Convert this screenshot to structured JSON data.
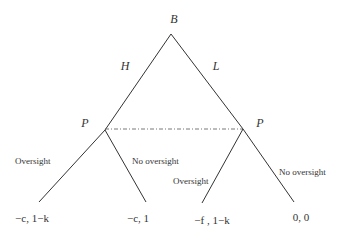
{
  "diagram": {
    "type": "game-tree",
    "root": {
      "label": "B"
    },
    "first_moves": [
      {
        "label": "H"
      },
      {
        "label": "L"
      }
    ],
    "decision_nodes": [
      {
        "label": "P"
      },
      {
        "label": "P"
      }
    ],
    "actions": {
      "left_node": [
        {
          "label": "Oversight"
        },
        {
          "label": "No oversight"
        }
      ],
      "right_node": [
        {
          "label": "Oversight"
        },
        {
          "label": "No oversight"
        }
      ]
    },
    "payoffs": [
      {
        "label": "−c, 1−k"
      },
      {
        "label": "−c, 1"
      },
      {
        "label": "−f , 1−k"
      },
      {
        "label": "0, 0"
      }
    ],
    "information_set": {
      "style": "dash-dot"
    }
  }
}
